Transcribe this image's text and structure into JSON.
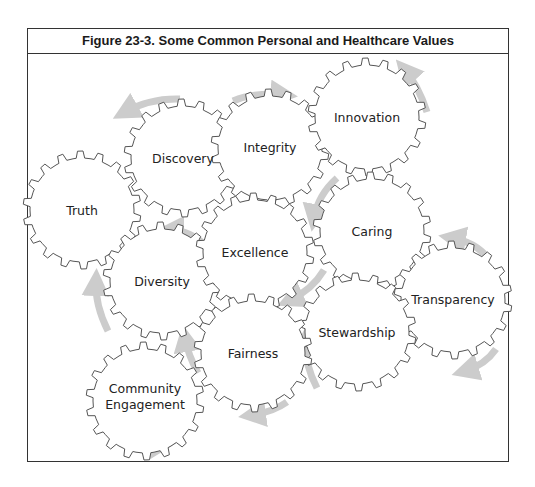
{
  "figure": {
    "title": "Figure 23-3. Some Common Personal and Healthcare Values"
  },
  "colors": {
    "gear_stroke": "#555555",
    "arrow": "#cccccc",
    "border": "#333333"
  },
  "gears": [
    {
      "id": "discovery",
      "label": "Discovery",
      "cx": 183,
      "cy": 158
    },
    {
      "id": "integrity",
      "label": "Integrity",
      "cx": 270,
      "cy": 148
    },
    {
      "id": "innovation",
      "label": "Innovation",
      "cx": 367,
      "cy": 117
    },
    {
      "id": "truth",
      "label": "Truth",
      "cx": 82,
      "cy": 210
    },
    {
      "id": "diversity",
      "label": "Diversity",
      "cx": 162,
      "cy": 281
    },
    {
      "id": "excellence",
      "label": "Excellence",
      "cx": 255,
      "cy": 252
    },
    {
      "id": "caring",
      "label": "Caring",
      "cx": 372,
      "cy": 231
    },
    {
      "id": "transparency",
      "label": "Transparency",
      "cx": 453,
      "cy": 300
    },
    {
      "id": "stewardship",
      "label": "Stewardship",
      "cx": 357,
      "cy": 332
    },
    {
      "id": "fairness",
      "label": "Fairness",
      "cx": 253,
      "cy": 353
    },
    {
      "id": "community-engagement",
      "label": "Community",
      "label2": "Engagement",
      "cx": 145,
      "cy": 401
    }
  ],
  "labels": {
    "discovery": "Discovery",
    "integrity": "Integrity",
    "innovation": "Innovation",
    "truth": "Truth",
    "diversity": "Diversity",
    "excellence": "Excellence",
    "caring": "Caring",
    "transparency": "Transparency",
    "stewardship": "Stewardship",
    "fairness": "Fairness",
    "community_line1": "Community",
    "community_line2": "Engagement"
  }
}
